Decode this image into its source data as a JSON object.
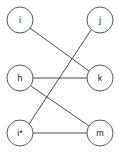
{
  "diagram": {
    "type": "node-link-graph",
    "width": 119,
    "height": 157,
    "background_color": "#ffffff",
    "node_fill_color": "#ffffff",
    "node_stroke_color": "#5a5a5a",
    "edge_color": "#4a4a4a",
    "label_color": "#1a1a1a",
    "node_radius": 13,
    "nodes": [
      {
        "id": "i",
        "label": "i",
        "cx": 20,
        "cy": 20
      },
      {
        "id": "j",
        "label": "j",
        "cx": 100,
        "cy": 20
      },
      {
        "id": "h",
        "label": "h",
        "cx": 20,
        "cy": 78
      },
      {
        "id": "k",
        "label": "k",
        "cx": 100,
        "cy": 78
      },
      {
        "id": "is",
        "label": "i*",
        "cx": 20,
        "cy": 133
      },
      {
        "id": "m",
        "label": "m",
        "cx": 100,
        "cy": 133
      }
    ],
    "edges": [
      {
        "id": "edge-i-k",
        "source": "i",
        "target": "k",
        "x1": 30,
        "y1": 28,
        "x2": 89,
        "y2": 71
      },
      {
        "id": "edge-j-is",
        "source": "j",
        "target": "is",
        "x1": 91,
        "y1": 30,
        "x2": 29,
        "y2": 124
      },
      {
        "id": "edge-h-k",
        "source": "h",
        "target": "k",
        "x1": 33,
        "y1": 78,
        "x2": 87,
        "y2": 78
      },
      {
        "id": "edge-h-m",
        "source": "h",
        "target": "m",
        "x1": 31,
        "y1": 86,
        "x2": 89,
        "y2": 126
      },
      {
        "id": "edge-is-m",
        "source": "is",
        "target": "m",
        "x1": 33,
        "y1": 133,
        "x2": 87,
        "y2": 133
      }
    ]
  }
}
